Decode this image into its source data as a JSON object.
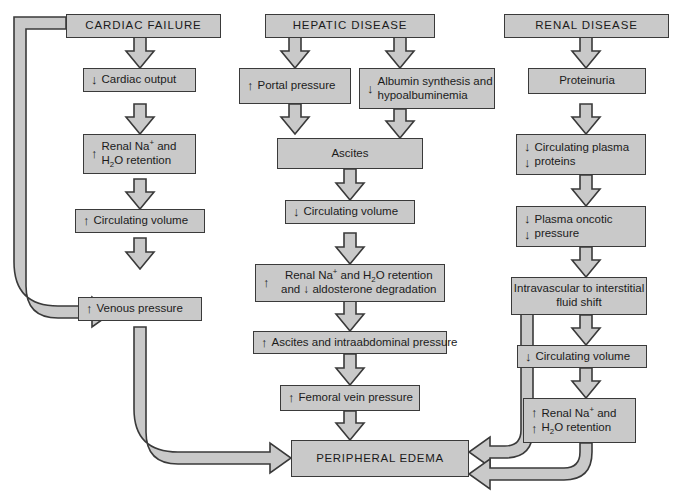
{
  "diagram": {
    "colors": {
      "node_fill": "#c9c9c9",
      "node_border": "#3a3a3a",
      "arrow_fill": "#c9c9c9",
      "arrow_stroke": "#3a3a3a",
      "background": "#ffffff",
      "text": "#1b1b1b"
    },
    "marks": {
      "up": "↑",
      "down": "↓"
    },
    "nodes": {
      "cardiac_failure": {
        "label": "CARDIAC FAILURE"
      },
      "hepatic_disease": {
        "label": "HEPATIC DISEASE"
      },
      "renal_disease": {
        "label": "RENAL DISEASE"
      },
      "cardiac_output": {
        "mark": "↓",
        "line1": "Cardiac output"
      },
      "renal_na_h2o_left": {
        "mark": "↑",
        "line1": "Renal Na",
        "line1_sup": "+",
        "line1_tail": " and",
        "line2_pre": "H",
        "line2_sub": "2",
        "line2_post": "O retention"
      },
      "circulating_volume_up": {
        "mark": "↑",
        "line1": "Circulating volume"
      },
      "venous_pressure": {
        "mark": "↑",
        "line1": "Venous pressure"
      },
      "portal_pressure": {
        "mark": "↑",
        "line1": "Portal pressure"
      },
      "albumin_synthesis": {
        "mark": "↓",
        "line1": "Albumin synthesis and",
        "line2": "hypoalbuminemia"
      },
      "ascites": {
        "label": "Ascites"
      },
      "circulating_volume_down_mid": {
        "mark": "↓",
        "line1": "Circulating volume"
      },
      "renal_na_aldosterone": {
        "mark1": "↑",
        "line1_pre": "Renal Na",
        "line1_sup": "+",
        "line1_mid": " and H",
        "line1_sub": "2",
        "line1_post": "O retention",
        "line2_pre": "and ",
        "line2_mark": "↓",
        "line2_post": " aldosterone degradation"
      },
      "ascites_intraabdominal": {
        "mark": "↑",
        "line1": "Ascites and intraabdominal pressure"
      },
      "femoral_vein_pressure": {
        "mark": "↑",
        "line1": "Femoral vein pressure"
      },
      "proteinuria": {
        "label": "Proteinuria"
      },
      "circulating_plasma_proteins": {
        "mark": "↓",
        "mark2": "↓",
        "line1": "Circulating plasma",
        "line2": "proteins"
      },
      "plasma_oncotic_pressure": {
        "mark": "↓",
        "mark2": "↓",
        "line1": "Plasma oncotic",
        "line2": "pressure"
      },
      "intravascular_shift": {
        "line1": "Intravascular to",
        "line2": "interstitial fluid shift"
      },
      "circulating_volume_down_right": {
        "mark": "↓",
        "line1": "Circulating volume"
      },
      "renal_na_h2o_right": {
        "mark": "↑",
        "mark2": "↑",
        "line1": "Renal Na",
        "line1_sup": "+",
        "line1_tail": " and",
        "line2_pre": "H",
        "line2_sub": "2",
        "line2_post": "O retention"
      },
      "peripheral_edema": {
        "label": "PERIPHERAL EDEMA"
      }
    }
  }
}
